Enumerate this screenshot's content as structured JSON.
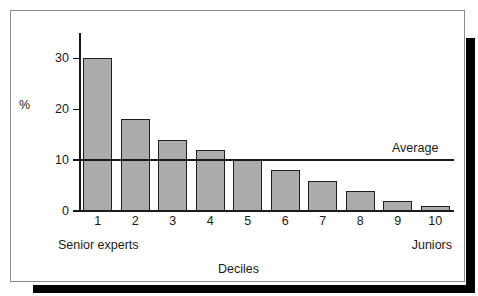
{
  "chart_data": {
    "type": "bar",
    "title": "",
    "subtitle": "",
    "xlabel": "Deciles",
    "ylabel": "%",
    "categories": [
      "1",
      "2",
      "3",
      "4",
      "5",
      "6",
      "7",
      "8",
      "9",
      "10"
    ],
    "values": [
      30,
      18,
      14,
      12,
      10,
      8,
      6,
      4,
      2,
      1
    ],
    "series": [
      {
        "name": "Share of output",
        "values": [
          30,
          18,
          14,
          12,
          10,
          8,
          6,
          4,
          2,
          1
        ]
      }
    ],
    "ylim": [
      0,
      35
    ],
    "xlim": [
      0,
      10
    ],
    "yticks": [
      0,
      10,
      20,
      30
    ],
    "ytick_labels": [
      "0",
      "10",
      "20",
      "30"
    ],
    "grid": false,
    "legend": "none",
    "bar_fill_color": "#ababab",
    "bar_edge_color": "#1f1f1f",
    "axis_color": "#1a1a1a",
    "background_color": "#ffffff",
    "annotations": [
      {
        "name": "average-line",
        "type": "hline",
        "value": 10,
        "label": "Average",
        "label_position": "right-above"
      },
      {
        "name": "left-edge-note",
        "type": "axis-note",
        "text": "Senior experts",
        "position": "x-axis-left"
      },
      {
        "name": "right-edge-note",
        "type": "axis-note",
        "text": "Juniors",
        "position": "x-axis-right"
      }
    ]
  },
  "labels": {
    "y_axis_title": "%",
    "x_axis_title": "Deciles",
    "average": "Average",
    "senior_experts": "Senior experts",
    "juniors": "Juniors"
  }
}
